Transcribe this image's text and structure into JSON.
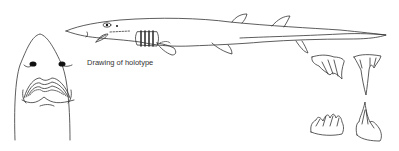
{
  "figure": {
    "caption": "Drawing of holotype",
    "elements": [
      "shark-head-ventral-view",
      "shark-lateral-view",
      "tooth-upper-left",
      "tooth-upper-right",
      "tooth-lower-left",
      "tooth-lower-right"
    ],
    "line_color": "#333333",
    "background": "#ffffff"
  }
}
